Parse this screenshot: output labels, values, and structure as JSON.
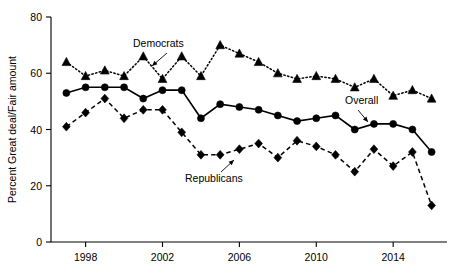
{
  "chart_data": {
    "type": "line",
    "title": "",
    "xlabel": "",
    "ylabel": "Percent Great deal/Fair amount",
    "xlim": [
      1996.2,
      2016.8
    ],
    "ylim": [
      0,
      80
    ],
    "grid": false,
    "legend_position": "inline-annotations",
    "y_ticks": [
      0,
      20,
      40,
      60,
      80
    ],
    "x_ticks": [
      1998,
      2002,
      2006,
      2010,
      2014
    ],
    "x": [
      1997,
      1998,
      1999,
      2000,
      2001,
      2002,
      2003,
      2004,
      2005,
      2006,
      2007,
      2008,
      2009,
      2010,
      2011,
      2012,
      2013,
      2014,
      2015,
      2016
    ],
    "series": [
      {
        "name": "Democrats",
        "marker": "triangle",
        "linestyle": "dotted",
        "values": [
          64,
          59,
          61,
          59,
          66,
          58,
          66,
          59,
          70,
          67,
          64,
          60,
          58,
          59,
          58,
          55,
          58,
          52,
          54,
          51
        ]
      },
      {
        "name": "Overall",
        "marker": "circle",
        "linestyle": "solid",
        "values": [
          53,
          55,
          55,
          55,
          51,
          54,
          54,
          44,
          49,
          48,
          47,
          45,
          43,
          44,
          45,
          40,
          42,
          42,
          40,
          32
        ]
      },
      {
        "name": "Republicans",
        "marker": "diamond",
        "linestyle": "dashed",
        "values": [
          41,
          46,
          51,
          44,
          47,
          47,
          39,
          31,
          31,
          33,
          35,
          30,
          36,
          34,
          31,
          25,
          33,
          27,
          32,
          13
        ]
      }
    ],
    "annotations": [
      {
        "label": "Democrats",
        "text_x": 133,
        "text_y": 47,
        "arrow_from_x": 167,
        "arrow_from_y": 53,
        "arrow_to_x": 152,
        "arrow_to_y": 66
      },
      {
        "label": "Republicans",
        "text_x": 185,
        "text_y": 182,
        "arrow_from_x": 221,
        "arrow_from_y": 172,
        "arrow_to_x": 234,
        "arrow_to_y": 160
      },
      {
        "label": "Overall",
        "text_x": 345,
        "text_y": 104,
        "arrow_from_x": 358,
        "arrow_from_y": 110,
        "arrow_to_x": 368,
        "arrow_to_y": 122
      }
    ]
  },
  "axes": {
    "y_title": "Percent Great deal/Fair amount",
    "y_tick_labels": [
      "0",
      "20",
      "40",
      "60",
      "80"
    ],
    "x_tick_labels": [
      "1998",
      "2002",
      "2006",
      "2010",
      "2014"
    ]
  }
}
